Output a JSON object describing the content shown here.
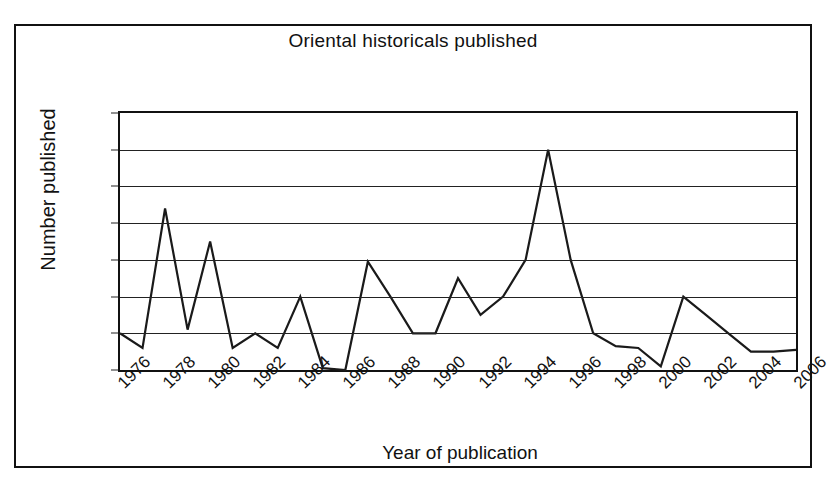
{
  "chart_data": {
    "type": "line",
    "title": "Oriental historicals published",
    "xlabel": "Year of publication",
    "ylabel": "Number published",
    "x": [
      1976,
      1977,
      1978,
      1979,
      1980,
      1981,
      1982,
      1983,
      1984,
      1985,
      1986,
      1987,
      1988,
      1989,
      1990,
      1991,
      1992,
      1993,
      1994,
      1995,
      1996,
      1997,
      1998,
      1999,
      2000,
      2001,
      2002,
      2003,
      2004,
      2005,
      2006
    ],
    "values": [
      2,
      1.2,
      8.8,
      2.2,
      7,
      1.2,
      2,
      1.2,
      4,
      0.1,
      0,
      5.9,
      4,
      2,
      2,
      5,
      3,
      4,
      6,
      12,
      6,
      2,
      1.3,
      1.2,
      0.2,
      4,
      3,
      2,
      1,
      1,
      1.1
    ],
    "series": [
      {
        "name": "Oriental historicals published",
        "values": [
          2,
          1.2,
          8.8,
          2.2,
          7,
          1.2,
          2,
          1.2,
          4,
          0.1,
          0,
          5.9,
          4,
          2,
          2,
          5,
          3,
          4,
          6,
          12,
          6,
          2,
          1.3,
          1.2,
          0.2,
          4,
          3,
          2,
          1,
          1,
          1.1
        ]
      }
    ],
    "xlim": [
      1976,
      2006
    ],
    "ylim": [
      0,
      14
    ],
    "ytick_labels": [
      "0",
      "2",
      "4",
      "6",
      "8",
      "10",
      "12",
      "14"
    ],
    "ytick_values": [
      0,
      2,
      4,
      6,
      8,
      10,
      12,
      14
    ],
    "xtick_labels": [
      "1976",
      "1978",
      "1980",
      "1982",
      "1984",
      "1986",
      "1988",
      "1990",
      "1992",
      "1994",
      "1996",
      "1998",
      "2000",
      "2002",
      "2004",
      "2006"
    ],
    "xtick_values": [
      1976,
      1978,
      1980,
      1982,
      1984,
      1986,
      1988,
      1990,
      1992,
      1994,
      1996,
      1998,
      2000,
      2002,
      2004,
      2006
    ],
    "grid": "horizontal",
    "legend": "none",
    "line_color": "#1a1a1a",
    "background_color": "#ffffff",
    "axis_color": "#111111"
  }
}
